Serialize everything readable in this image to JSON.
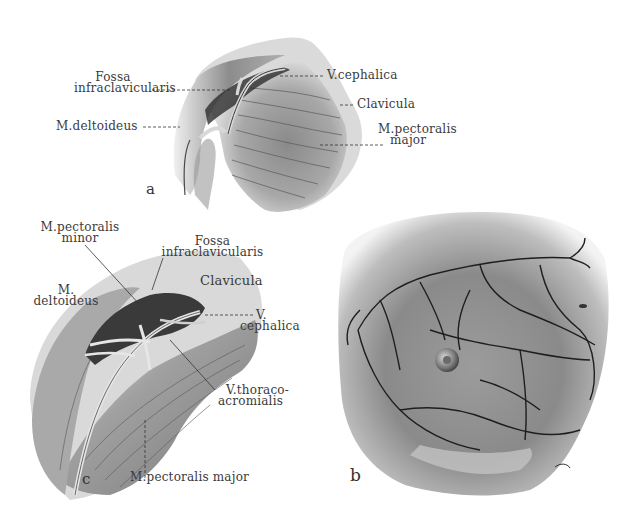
{
  "figure": {
    "panels": [
      {
        "id": "a",
        "letter": "a",
        "labels": {
          "fossa_line1": "Fossa",
          "fossa_line2": "infraclavicularis",
          "deltoideus": "M.deltoideus",
          "cephalica": "V.cephalica",
          "clavicula": "Clavicula",
          "pectoralis_line1": "M.pectoralis",
          "pectoralis_line2": "major"
        }
      },
      {
        "id": "c",
        "letter": "c",
        "labels": {
          "pect_minor_line1": "M.pectoralis",
          "pect_minor_line2": "minor",
          "fossa_line1": "Fossa",
          "fossa_line2": "infraclavicularis",
          "clavicula": "Clavicula",
          "deltoideus_line1": "M.",
          "deltoideus_line2": "deltoideus",
          "cephalica_line1": "V.",
          "cephalica_line2": "cephalica",
          "thoraco_line1": "V.thoraco-",
          "thoraco_line2": "acromialis",
          "pect_major": "M.pectoralis major"
        }
      },
      {
        "id": "b",
        "letter": "b",
        "labels": {}
      }
    ],
    "colors": {
      "ink": "#2a2a2a",
      "muscle_dark": "#6a6a6a",
      "muscle_mid": "#9a9a9a",
      "muscle_light": "#c8c8c8",
      "skin": "#d9d9d9",
      "vein": "#1e1e1e"
    }
  }
}
